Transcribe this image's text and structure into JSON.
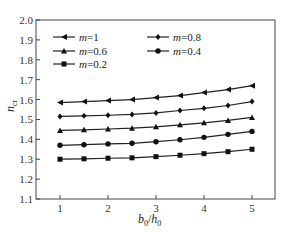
{
  "chart_data": {
    "type": "line",
    "title": "",
    "xlabel": "b0/h0",
    "ylabel": "n_cr",
    "xlim": [
      0.7,
      5.5
    ],
    "ylim": [
      1.1,
      2.0
    ],
    "xticks": [
      1,
      2,
      3,
      4,
      5
    ],
    "yticks": [
      1.1,
      1.2,
      1.3,
      1.4,
      1.5,
      1.6,
      1.7,
      1.8,
      1.9,
      2.0
    ],
    "grid": false,
    "legend_position": "upper left",
    "x": [
      1,
      1.5,
      2,
      2.5,
      3,
      3.5,
      4,
      4.5,
      5
    ],
    "series": [
      {
        "name": "m=1",
        "marker": "triangle-left",
        "values": [
          1.585,
          1.59,
          1.595,
          1.6,
          1.61,
          1.62,
          1.635,
          1.65,
          1.67
        ]
      },
      {
        "name": "m=0.8",
        "marker": "diamond",
        "values": [
          1.515,
          1.518,
          1.521,
          1.525,
          1.533,
          1.545,
          1.556,
          1.57,
          1.59
        ]
      },
      {
        "name": "m=0.6",
        "marker": "triangle-up",
        "values": [
          1.445,
          1.448,
          1.452,
          1.456,
          1.463,
          1.473,
          1.483,
          1.495,
          1.51
        ]
      },
      {
        "name": "m=0.4",
        "marker": "circle",
        "values": [
          1.37,
          1.373,
          1.377,
          1.38,
          1.388,
          1.398,
          1.41,
          1.425,
          1.44
        ]
      },
      {
        "name": "m=0.2",
        "marker": "square",
        "values": [
          1.3,
          1.302,
          1.305,
          1.307,
          1.313,
          1.32,
          1.328,
          1.338,
          1.35
        ]
      }
    ]
  },
  "axes": {
    "ylabel_main": "n",
    "ylabel_sub": "cr",
    "xlabel_num": "b",
    "xlabel_num_sub": "0",
    "xlabel_den": "h",
    "xlabel_den_sub": "0"
  },
  "legend": [
    {
      "prefix": "m",
      "text": "=1"
    },
    {
      "prefix": "m",
      "text": "=0.8"
    },
    {
      "prefix": "m",
      "text": "=0.6"
    },
    {
      "prefix": "m",
      "text": "=0.4"
    },
    {
      "prefix": "m",
      "text": "=0.2"
    }
  ]
}
